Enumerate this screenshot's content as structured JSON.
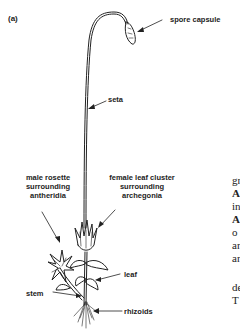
{
  "figure": {
    "panel_label": "(a)",
    "labels": {
      "spore_capsule": "spore capsule",
      "seta": "seta",
      "male_rosette": [
        "male rosette",
        "surrounding",
        "antheridia"
      ],
      "female_cluster": [
        "female leaf cluster",
        "surrounding",
        "archegonia"
      ],
      "leaf": "leaf",
      "stem": "stem",
      "rhizoids": "rhizoids"
    }
  },
  "body_text_fragments": [
    "gr",
    "A",
    "in",
    "A",
    "o",
    "ar",
    "ar",
    "",
    "de",
    "T"
  ]
}
